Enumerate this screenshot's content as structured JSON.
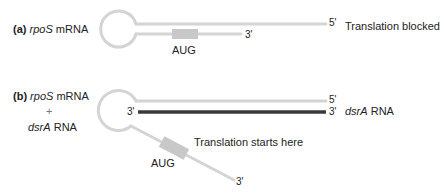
{
  "panel_a": {
    "letter": "(a)",
    "gene": "rpoS",
    "molecule": "mRNA",
    "start_codon": "AUG",
    "end_3": "3'",
    "end_5": "5'",
    "status": "Translation blocked"
  },
  "panel_b": {
    "letter": "(b)",
    "gene": "rpoS",
    "molecule": "mRNA",
    "plus": "+",
    "srna_gene": "dsrA",
    "srna_molecule": "RNA",
    "start_codon": "AUG",
    "end_5": "5'",
    "end_3_top": "3'",
    "end_3_left": "3'",
    "end_3_bottom": "3'",
    "srna_label_gene": "dsrA",
    "srna_label_molecule": "RNA",
    "status": "Translation starts here"
  },
  "colors": {
    "mrna_strand": "#d4d4d4",
    "start_codon_box": "#c8c8c8",
    "dsrA_strand": "#3a3a3a",
    "text": "#222222"
  }
}
